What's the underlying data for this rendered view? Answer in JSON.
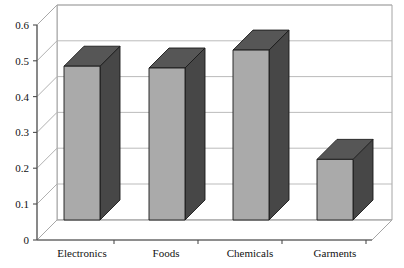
{
  "chart_data": {
    "type": "bar",
    "title": "",
    "subtitle": "",
    "xlabel": "",
    "ylabel": "",
    "categories": [
      "Electronics",
      "Foods",
      "Chemicals",
      "Garments"
    ],
    "values": [
      0.485,
      0.48,
      0.53,
      0.225
    ],
    "series": [
      {
        "name": "Series 1",
        "values": [
          0.485,
          0.48,
          0.53,
          0.225
        ]
      }
    ],
    "ylim": [
      0,
      0.6
    ],
    "ytick_labels": [
      "0",
      "0.1",
      "0.2",
      "0.3",
      "0.4",
      "0.5",
      "0.6"
    ],
    "ytick_values": [
      0,
      0.1,
      0.2,
      0.3,
      0.4,
      0.5,
      0.6
    ],
    "grid": true,
    "legend": false,
    "legend_position": "none",
    "style": "3d-column",
    "colors": {
      "bar_front": "#aaaaaa",
      "bar_side": "#474747",
      "bar_top": "#565656",
      "bar_outline": "#1a1a1a",
      "gridline": "#b3b3b3",
      "wall": "#ffffff",
      "wall_outline": "#9a9a9a",
      "axis": "#4d4d4d",
      "text": "#111111",
      "background": "#ffffff"
    }
  },
  "axes": {
    "y": {
      "ticks": [
        {
          "label": "0.6",
          "value": 0.6
        },
        {
          "label": "0.5",
          "value": 0.5
        },
        {
          "label": "0.4",
          "value": 0.4
        },
        {
          "label": "0.3",
          "value": 0.3
        },
        {
          "label": "0.2",
          "value": 0.2
        },
        {
          "label": "0.1",
          "value": 0.1
        },
        {
          "label": "0",
          "value": 0
        }
      ]
    },
    "x": {
      "ticks": [
        {
          "label": "Electronics"
        },
        {
          "label": "Foods"
        },
        {
          "label": "Chemicals"
        },
        {
          "label": "Garments"
        }
      ]
    }
  }
}
